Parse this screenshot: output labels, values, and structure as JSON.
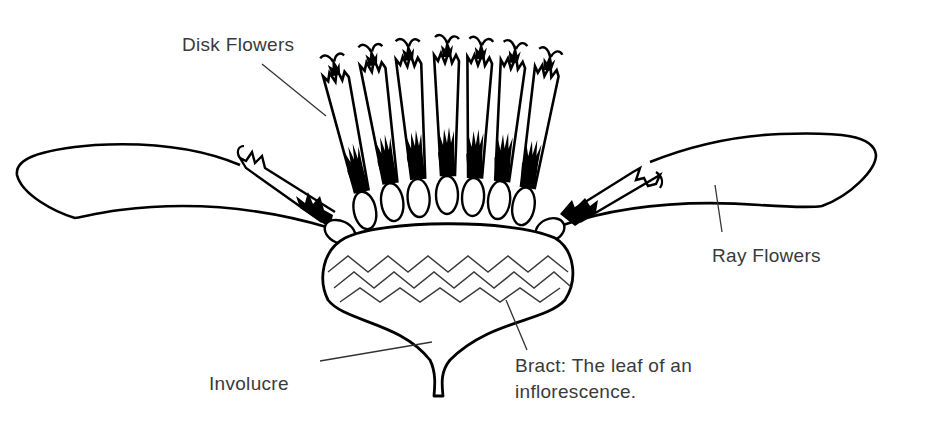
{
  "diagram": {
    "type": "botanical-illustration",
    "labels": {
      "disk_flowers": "Disk Flowers",
      "ray_flowers": "Ray Flowers",
      "involucre": "Involucre",
      "bract_line1": "Bract: The leaf of an",
      "bract_line2": "inflorescence."
    },
    "parts": [
      {
        "name": "disk-flower",
        "count": 7
      },
      {
        "name": "ray-flower",
        "count": 2
      },
      {
        "name": "involucre",
        "count": 1
      },
      {
        "name": "bract-zigzag",
        "count": 3
      }
    ],
    "colors": {
      "stroke": "#000000",
      "leader": "#333333",
      "text": "#3a3a3a",
      "background": "#ffffff"
    }
  }
}
